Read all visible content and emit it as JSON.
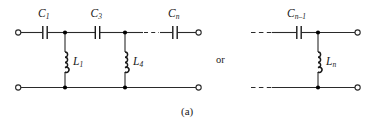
{
  "figure": {
    "caption": "(a)",
    "connector_text": "or",
    "stroke_color": "#2a2a2a",
    "node_color": "#000000",
    "background": "#ffffff",
    "width": 379,
    "height": 129
  },
  "left_circuit": {
    "name": "ladder-network-left",
    "series_capacitors": [
      {
        "label": "C",
        "subscript": "1"
      },
      {
        "label": "C",
        "subscript": "3"
      },
      {
        "label": "C",
        "subscript": "n"
      }
    ],
    "shunt_inductors": [
      {
        "label": "L",
        "subscript": "1"
      },
      {
        "label": "L",
        "subscript": "4"
      }
    ],
    "terminals": [
      "input-top",
      "input-bottom",
      "output-top",
      "output-bottom"
    ],
    "has_ellipsis": true
  },
  "right_circuit": {
    "name": "ladder-network-right",
    "series_capacitors": [
      {
        "label": "C",
        "subscript": "n–1"
      }
    ],
    "shunt_inductors": [
      {
        "label": "L",
        "subscript": "n"
      }
    ],
    "terminals": [
      "output-top",
      "output-bottom"
    ],
    "has_ellipsis": true
  }
}
